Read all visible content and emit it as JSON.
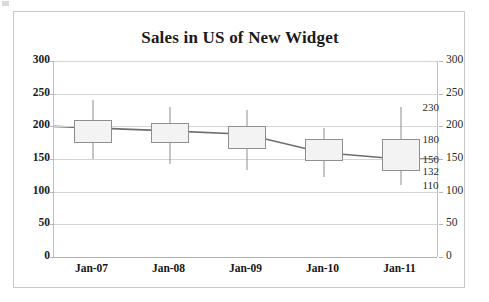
{
  "chart_data": {
    "type": "bar",
    "subtype": "open-high-low-close stock chart (box and whisker)",
    "title": "Sales in US of New Widget",
    "xlabel": "",
    "ylabel": "",
    "categories": [
      "Jan-07",
      "Jan-08",
      "Jan-09",
      "Jan-10",
      "Jan-11"
    ],
    "ylim": [
      0,
      300
    ],
    "yticks": [
      0,
      50,
      100,
      150,
      200,
      250,
      300
    ],
    "ytick_labels_left": [
      "0",
      "50",
      "100",
      "150",
      "200",
      "250",
      "300"
    ],
    "ytick_labels_right": [
      "0",
      "50",
      "100",
      "150",
      "200",
      "250",
      "300"
    ],
    "grid": true,
    "legend": "none",
    "dual_axis": true,
    "series": [
      {
        "name": "High",
        "values": [
          240,
          230,
          225,
          198,
          230
        ]
      },
      {
        "name": "Open",
        "values": [
          210,
          205,
          200,
          180,
          180
        ]
      },
      {
        "name": "Close",
        "values": [
          200,
          193,
          188,
          160,
          150
        ]
      },
      {
        "name": "Low_box",
        "values": [
          175,
          175,
          165,
          147,
          132
        ]
      },
      {
        "name": "Low",
        "values": [
          150,
          142,
          133,
          123,
          110
        ]
      }
    ],
    "points": [
      {
        "category": "Jan-07",
        "high": 240,
        "box_top": 210,
        "close": 200,
        "box_bottom": 175,
        "low": 150
      },
      {
        "category": "Jan-08",
        "high": 230,
        "box_top": 205,
        "close": 193,
        "box_bottom": 175,
        "low": 142
      },
      {
        "category": "Jan-09",
        "high": 225,
        "box_top": 200,
        "close": 188,
        "box_bottom": 165,
        "low": 133
      },
      {
        "category": "Jan-10",
        "high": 198,
        "box_top": 180,
        "close": 160,
        "box_bottom": 147,
        "low": 123
      },
      {
        "category": "Jan-11",
        "high": 230,
        "box_top": 180,
        "close": 150,
        "box_bottom": 132,
        "low": 110
      }
    ],
    "data_labels": {
      "category": "Jan-11",
      "values": [
        "230",
        "180",
        "150",
        "132",
        "110"
      ]
    },
    "colors": {
      "box_fill": "#f3f3f3",
      "box_border": "#8f8f8f",
      "whisker": "#8c8c8c",
      "trendline": "#6e6e6e",
      "gridline": "#d4d4d4",
      "frame": "#c9c9c9",
      "text": "#1a1a1a",
      "background": "#ffffff"
    }
  }
}
